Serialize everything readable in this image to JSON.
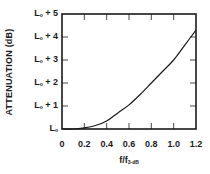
{
  "chart_data": {
    "type": "line",
    "title": "",
    "xlabel": "f/f3-dB",
    "xlabel_main": "f/f",
    "xlabel_sub": "3-dB",
    "ylabel": "ATTENUATION (dB)",
    "xlim": [
      0,
      1.2
    ],
    "ylim": [
      0,
      5
    ],
    "grid": false,
    "legend": null,
    "x_ticks": [
      "0",
      "0.2",
      "0.4",
      "0.6",
      "0.8",
      "1.0",
      "1.2"
    ],
    "y_ticks": [
      {
        "base": "L",
        "sub": "o",
        "suffix": ""
      },
      {
        "base": "L",
        "sub": "o",
        "suffix": " + 1"
      },
      {
        "base": "L",
        "sub": "o",
        "suffix": " + 2"
      },
      {
        "base": "L",
        "sub": "o",
        "suffix": " + 3"
      },
      {
        "base": "L",
        "sub": "o",
        "suffix": " + 4"
      },
      {
        "base": "L",
        "sub": "o",
        "suffix": " + 5"
      }
    ],
    "series": [
      {
        "name": "attenuation",
        "x": [
          0.0,
          0.1,
          0.2,
          0.3,
          0.4,
          0.5,
          0.6,
          0.7,
          0.8,
          0.9,
          1.0,
          1.1,
          1.2
        ],
        "values": [
          0.0,
          0.0,
          0.05,
          0.15,
          0.35,
          0.7,
          1.05,
          1.5,
          2.0,
          2.5,
          3.0,
          3.65,
          4.3
        ]
      }
    ],
    "colors": {
      "axis": "#1a1a1a",
      "line": "#1a1a1a",
      "background": "#ffffff"
    }
  }
}
